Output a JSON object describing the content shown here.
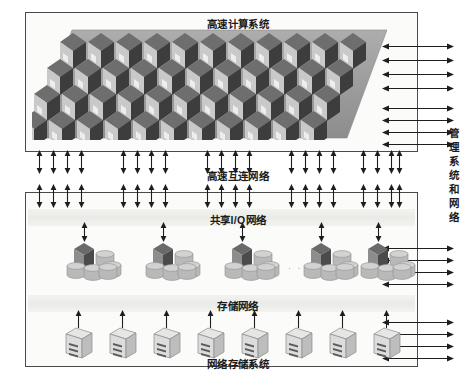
{
  "figure": {
    "panels": {
      "compute": {
        "title": "高速计算系统"
      },
      "storage": {
        "title_shared_io": "共享I/O网络",
        "title_storage_net": "存储网络",
        "title_network_storage": "网络存储系统"
      }
    },
    "interconnect_label": "高速互连网络",
    "management_label": "管理系统和网络",
    "cluster_ellipsis": "· · · ·",
    "caption": "",
    "colors": {
      "panel_border": "#4a4a4a",
      "panel_fill": "#fbfbfa",
      "cube_dark": "#3d3d3d",
      "cube_mid": "#6e6e6e",
      "cube_light": "#c9c9c9",
      "platform": "#9a9a9a",
      "disk_fill": "#b9b9b9",
      "server_fill": "#d8d8d8",
      "arrow": "#1e1e1e",
      "text": "#1b1b1b"
    },
    "compute_grid": {
      "rows": 4,
      "cols": 11,
      "description": "isometric cube array"
    },
    "storage_clusters": {
      "count": 5,
      "disks_per_cluster": 5
    },
    "network_servers": {
      "count": 8
    },
    "arrow_groups": {
      "vertical_top": {
        "count": 20,
        "direction": "bidirectional"
      },
      "vertical_bottom": {
        "count": 20,
        "direction": "bidirectional"
      },
      "right_compute_upper": {
        "count": 4,
        "direction": "bidirectional"
      },
      "right_compute_lower": {
        "count": 4,
        "direction": "bidirectional"
      },
      "right_io": {
        "count": 4,
        "direction": "bidirectional"
      },
      "right_storage": {
        "count": 4,
        "direction": "bidirectional"
      },
      "cluster_uplinks": {
        "count": 5,
        "direction": "bidirectional"
      },
      "server_uplinks": {
        "count": 8,
        "direction": "up"
      }
    }
  }
}
